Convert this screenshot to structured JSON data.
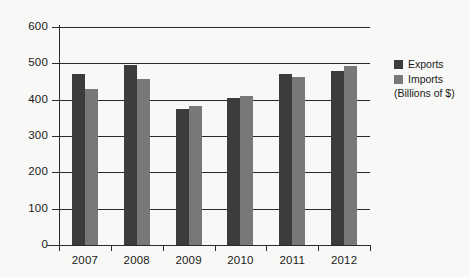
{
  "chart_data": {
    "type": "bar",
    "title": "",
    "xlabel": "",
    "ylabel": "",
    "units_note": "(Billions of $)",
    "categories": [
      "2007",
      "2008",
      "2009",
      "2010",
      "2011",
      "2012"
    ],
    "series": [
      {
        "name": "Exports",
        "color": "#3c3c3c",
        "values": [
          470,
          495,
          375,
          405,
          472,
          480
        ]
      },
      {
        "name": "Imports",
        "color": "#787878",
        "values": [
          430,
          458,
          382,
          410,
          463,
          492
        ]
      }
    ],
    "ylim": [
      0,
      600
    ],
    "yticks": [
      "0",
      "100",
      "200",
      "300",
      "400",
      "500",
      "600"
    ],
    "ytick_values": [
      0,
      100,
      200,
      300,
      400,
      500,
      600
    ],
    "grid": true,
    "legend_position": "right"
  },
  "legend": {
    "entries": [
      {
        "label": "Exports",
        "swatch": "exports"
      },
      {
        "label": "Imports",
        "swatch": "imports"
      }
    ],
    "units": "(Billions of $)"
  },
  "colors": {
    "exports": "#3c3c3c",
    "imports": "#787878",
    "axis": "#2b2b2b",
    "background": "#f8f8f6"
  }
}
